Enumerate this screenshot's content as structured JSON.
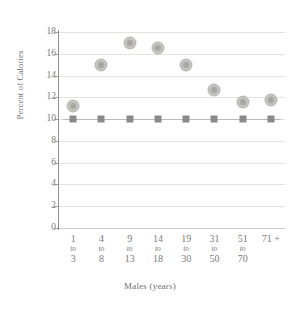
{
  "chart_data": {
    "type": "scatter",
    "title": "",
    "xlabel": "Males (years)",
    "ylabel": "Percent of Calories",
    "ylim": [
      0,
      18
    ],
    "yticks": [
      0,
      2,
      4,
      6,
      8,
      10,
      12,
      14,
      16,
      18
    ],
    "ytick_labels": [
      "0",
      "2",
      "4",
      "6",
      "8",
      "10",
      "12",
      "14",
      "16",
      "18"
    ],
    "grid": true,
    "legend": "none",
    "categories": [
      {
        "from": "1",
        "conn": "to",
        "to": "3"
      },
      {
        "from": "4",
        "conn": "to",
        "to": "8"
      },
      {
        "from": "9",
        "conn": "to",
        "to": "13"
      },
      {
        "from": "14",
        "conn": "to",
        "to": "18"
      },
      {
        "from": "19",
        "conn": "to",
        "to": "30"
      },
      {
        "from": "31",
        "conn": "to",
        "to": "50"
      },
      {
        "from": "51",
        "conn": "to",
        "to": "70"
      },
      {
        "from": "71 +",
        "conn": "",
        "to": ""
      }
    ],
    "series": [
      {
        "name": "intake",
        "marker": "circle",
        "color": "#b0aeaa",
        "connected": false,
        "values": [
          11.2,
          15.0,
          17.0,
          16.5,
          15.0,
          12.7,
          11.6,
          11.8
        ]
      },
      {
        "name": "recommendation",
        "marker": "square",
        "color": "#8b8a86",
        "connected": true,
        "values": [
          10.0,
          10.0,
          10.0,
          10.0,
          10.0,
          10.0,
          10.0,
          10.0
        ]
      }
    ]
  },
  "colors": {
    "gridline": "#e4e3df",
    "axis": "#8f8f8b",
    "text": "#7b7b78",
    "title_text": "#6f6f6c",
    "circle_marker": "#b0aeaa",
    "square_marker": "#8b8a86",
    "series_line": "#b9b8b4",
    "background": "#ffffff"
  }
}
